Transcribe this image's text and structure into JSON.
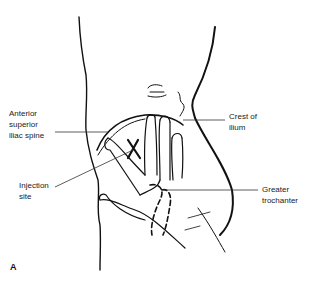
{
  "figure": {
    "panel": "A",
    "labels": {
      "asis": "Anterior\nsuperior\niliac spine",
      "crest": "Crest of\nilium",
      "injection": "Injection\nsite",
      "trochanter": "Greater\ntrochanter"
    },
    "colors": {
      "line": "#111111",
      "leader": "#333333",
      "text": "#222222"
    }
  }
}
